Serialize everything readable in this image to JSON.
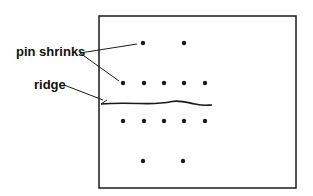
{
  "diagram": {
    "labels": {
      "pin_shrinks": "pin shrinks",
      "ridge": "ridge"
    },
    "colors": {
      "ink": "#1a1a1a",
      "background": "#ffffff"
    },
    "box": {
      "x": 99,
      "y": 16,
      "width": 197,
      "height": 172
    },
    "dots": [
      {
        "x": 143,
        "y": 43
      },
      {
        "x": 184,
        "y": 43
      },
      {
        "x": 123,
        "y": 83
      },
      {
        "x": 144,
        "y": 83
      },
      {
        "x": 164,
        "y": 83
      },
      {
        "x": 184,
        "y": 83
      },
      {
        "x": 205,
        "y": 83
      },
      {
        "x": 123,
        "y": 121
      },
      {
        "x": 144,
        "y": 121
      },
      {
        "x": 164,
        "y": 121
      },
      {
        "x": 184,
        "y": 121
      },
      {
        "x": 205,
        "y": 121
      },
      {
        "x": 143,
        "y": 161
      },
      {
        "x": 183,
        "y": 161
      }
    ]
  }
}
